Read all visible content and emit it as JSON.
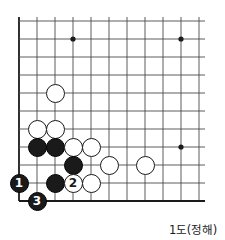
{
  "caption": "1도(정해)",
  "colors": {
    "line": "#4a4a4a",
    "edge_line": "#1a1a1a",
    "black_stone": "#1a1a1a",
    "white_stone": "#ffffff",
    "background": "#ffffff",
    "text": "#1a1a1a"
  },
  "board": {
    "origin_x": 19,
    "origin_y": 21,
    "spacing": 18,
    "cols": 11,
    "rows": 11,
    "stone_radius": 9.5,
    "star_point_radius": 2.6,
    "star_points": [
      {
        "col": 3,
        "row": 1
      },
      {
        "col": 9,
        "row": 1
      },
      {
        "col": 9,
        "row": 7
      }
    ]
  },
  "stones": [
    {
      "col": 2,
      "row": 4,
      "color": "white",
      "label": ""
    },
    {
      "col": 1,
      "row": 6,
      "color": "white",
      "label": ""
    },
    {
      "col": 2,
      "row": 6,
      "color": "white",
      "label": ""
    },
    {
      "col": 1,
      "row": 7,
      "color": "black",
      "label": ""
    },
    {
      "col": 2,
      "row": 7,
      "color": "black",
      "label": ""
    },
    {
      "col": 3,
      "row": 7,
      "color": "white",
      "label": ""
    },
    {
      "col": 4,
      "row": 7,
      "color": "white",
      "label": ""
    },
    {
      "col": 3,
      "row": 8,
      "color": "black",
      "label": ""
    },
    {
      "col": 5,
      "row": 8,
      "color": "white",
      "label": ""
    },
    {
      "col": 7,
      "row": 8,
      "color": "white",
      "label": ""
    },
    {
      "col": 0,
      "row": 9,
      "color": "black",
      "label": "1"
    },
    {
      "col": 2,
      "row": 9,
      "color": "black",
      "label": ""
    },
    {
      "col": 3,
      "row": 9,
      "color": "white",
      "label": "2"
    },
    {
      "col": 4,
      "row": 9,
      "color": "white",
      "label": ""
    },
    {
      "col": 1,
      "row": 10,
      "color": "black",
      "label": "3"
    }
  ]
}
